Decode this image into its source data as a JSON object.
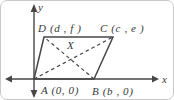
{
  "figure": {
    "axes": {
      "x_label": "x",
      "y_label": "y"
    },
    "points": {
      "A": "A (0, 0)",
      "B": "B (b , 0)",
      "C": "C (c , e )",
      "D": "D (d , f )",
      "X": "X"
    },
    "colors": {
      "line": "#474747",
      "text": "#383838",
      "background": "#ffffff"
    }
  }
}
